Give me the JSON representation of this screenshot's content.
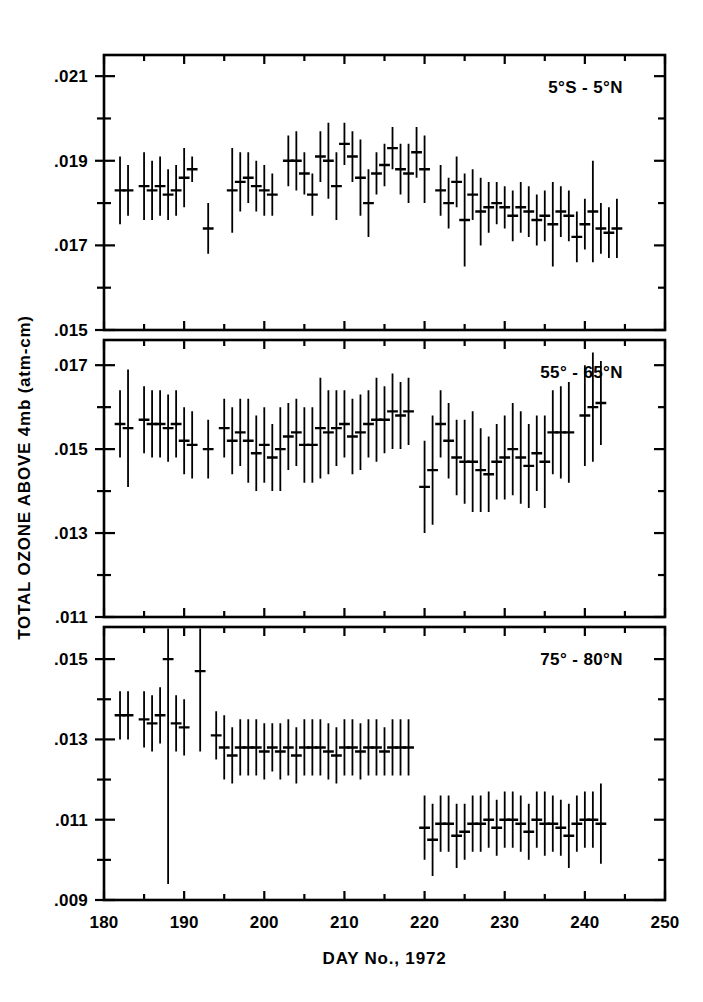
{
  "figure": {
    "background": "#ffffff",
    "ink": "#000000",
    "ylabel": "TOTAL OZONE ABOVE 4mb (atm-cm)",
    "xlabel": "DAY No., 1972"
  },
  "chart_data": {
    "type": "scatter",
    "title": "",
    "subtitle": "",
    "xlabel": "DAY No., 1972",
    "ylabel": "TOTAL OZONE ABOVE 4mb (atm-cm)",
    "grid": false,
    "legend": "none",
    "marker": "horizontal-dash-with-vertical-errorbar",
    "xlim": [
      180,
      250
    ],
    "xticks": [
      180,
      190,
      200,
      210,
      220,
      230,
      240,
      250
    ],
    "xticklabels": [
      "180",
      "190",
      "200",
      "210",
      "220",
      "230",
      "240",
      "250"
    ],
    "xminortick_step": 5,
    "panels": [
      {
        "name": "panel-equatorial",
        "label": "5°S - 5°N",
        "ylim": [
          0.015,
          0.0215
        ],
        "yticks": [
          0.015,
          0.017,
          0.019,
          0.021
        ],
        "yticklabels": [
          ".015",
          ".017",
          ".019",
          ".021"
        ],
        "yminortick_step": 0.001,
        "points": [
          {
            "x": 182,
            "y": 0.0183,
            "err": 0.0008
          },
          {
            "x": 183,
            "y": 0.0183,
            "err": 0.0006
          },
          {
            "x": 185,
            "y": 0.0184,
            "err": 0.0008
          },
          {
            "x": 186,
            "y": 0.0183,
            "err": 0.0007
          },
          {
            "x": 187,
            "y": 0.0184,
            "err": 0.0007
          },
          {
            "x": 188,
            "y": 0.0182,
            "err": 0.0006
          },
          {
            "x": 189,
            "y": 0.0183,
            "err": 0.0006
          },
          {
            "x": 190,
            "y": 0.0186,
            "err": 0.0007
          },
          {
            "x": 191,
            "y": 0.0188,
            "err": 0.0003
          },
          {
            "x": 193,
            "y": 0.0174,
            "err": 0.0006
          },
          {
            "x": 196,
            "y": 0.0183,
            "err": 0.001
          },
          {
            "x": 197,
            "y": 0.0185,
            "err": 0.0007
          },
          {
            "x": 198,
            "y": 0.0186,
            "err": 0.0006
          },
          {
            "x": 199,
            "y": 0.0184,
            "err": 0.0006
          },
          {
            "x": 200,
            "y": 0.0183,
            "err": 0.0006
          },
          {
            "x": 201,
            "y": 0.0182,
            "err": 0.0005
          },
          {
            "x": 203,
            "y": 0.019,
            "err": 0.0006
          },
          {
            "x": 204,
            "y": 0.019,
            "err": 0.0007
          },
          {
            "x": 205,
            "y": 0.0187,
            "err": 0.0005
          },
          {
            "x": 206,
            "y": 0.0182,
            "err": 0.0005
          },
          {
            "x": 207,
            "y": 0.0191,
            "err": 0.0006
          },
          {
            "x": 208,
            "y": 0.019,
            "err": 0.0009
          },
          {
            "x": 209,
            "y": 0.0184,
            "err": 0.0008
          },
          {
            "x": 210,
            "y": 0.0194,
            "err": 0.0005
          },
          {
            "x": 211,
            "y": 0.0191,
            "err": 0.0006
          },
          {
            "x": 212,
            "y": 0.0186,
            "err": 0.0009
          },
          {
            "x": 213,
            "y": 0.018,
            "err": 0.0008
          },
          {
            "x": 214,
            "y": 0.0187,
            "err": 0.0005
          },
          {
            "x": 215,
            "y": 0.0189,
            "err": 0.0005
          },
          {
            "x": 216,
            "y": 0.0193,
            "err": 0.0005
          },
          {
            "x": 217,
            "y": 0.0188,
            "err": 0.0006
          },
          {
            "x": 218,
            "y": 0.0187,
            "err": 0.0007
          },
          {
            "x": 219,
            "y": 0.0192,
            "err": 0.0006
          },
          {
            "x": 220,
            "y": 0.0188,
            "err": 0.0008
          },
          {
            "x": 222,
            "y": 0.0183,
            "err": 0.0006
          },
          {
            "x": 223,
            "y": 0.018,
            "err": 0.0006
          },
          {
            "x": 224,
            "y": 0.0185,
            "err": 0.0006
          },
          {
            "x": 225,
            "y": 0.0176,
            "err": 0.0011
          },
          {
            "x": 226,
            "y": 0.0182,
            "err": 0.0006
          },
          {
            "x": 227,
            "y": 0.0178,
            "err": 0.0008
          },
          {
            "x": 228,
            "y": 0.0179,
            "err": 0.0006
          },
          {
            "x": 229,
            "y": 0.018,
            "err": 0.0005
          },
          {
            "x": 230,
            "y": 0.0179,
            "err": 0.0005
          },
          {
            "x": 231,
            "y": 0.0177,
            "err": 0.0006
          },
          {
            "x": 232,
            "y": 0.0179,
            "err": 0.0006
          },
          {
            "x": 233,
            "y": 0.0178,
            "err": 0.0006
          },
          {
            "x": 234,
            "y": 0.0176,
            "err": 0.0006
          },
          {
            "x": 235,
            "y": 0.0177,
            "err": 0.0006
          },
          {
            "x": 236,
            "y": 0.0175,
            "err": 0.001
          },
          {
            "x": 237,
            "y": 0.0178,
            "err": 0.0006
          },
          {
            "x": 238,
            "y": 0.0177,
            "err": 0.0006
          },
          {
            "x": 239,
            "y": 0.0172,
            "err": 0.0006
          },
          {
            "x": 240,
            "y": 0.0175,
            "err": 0.0006
          },
          {
            "x": 241,
            "y": 0.0178,
            "err": 0.0012
          },
          {
            "x": 242,
            "y": 0.0174,
            "err": 0.0006
          },
          {
            "x": 243,
            "y": 0.0173,
            "err": 0.0006
          },
          {
            "x": 244,
            "y": 0.0174,
            "err": 0.0007
          }
        ]
      },
      {
        "name": "panel-midlatitude",
        "label": "55° - 65°N",
        "ylim": [
          0.011,
          0.0176
        ],
        "yticks": [
          0.011,
          0.013,
          0.015,
          0.017
        ],
        "yticklabels": [
          ".011",
          ".013",
          ".015",
          ".017"
        ],
        "yminortick_step": 0.001,
        "points": [
          {
            "x": 182,
            "y": 0.0156,
            "err": 0.0008
          },
          {
            "x": 183,
            "y": 0.0155,
            "err": 0.0014
          },
          {
            "x": 185,
            "y": 0.0157,
            "err": 0.0008
          },
          {
            "x": 186,
            "y": 0.0156,
            "err": 0.0008
          },
          {
            "x": 187,
            "y": 0.0156,
            "err": 0.0008
          },
          {
            "x": 188,
            "y": 0.0155,
            "err": 0.0008
          },
          {
            "x": 189,
            "y": 0.0156,
            "err": 0.0008
          },
          {
            "x": 190,
            "y": 0.0152,
            "err": 0.0008
          },
          {
            "x": 191,
            "y": 0.0151,
            "err": 0.0008
          },
          {
            "x": 193,
            "y": 0.015,
            "err": 0.0007
          },
          {
            "x": 195,
            "y": 0.0155,
            "err": 0.0007
          },
          {
            "x": 196,
            "y": 0.0152,
            "err": 0.0008
          },
          {
            "x": 197,
            "y": 0.0154,
            "err": 0.0008
          },
          {
            "x": 198,
            "y": 0.0152,
            "err": 0.001
          },
          {
            "x": 199,
            "y": 0.0149,
            "err": 0.0009
          },
          {
            "x": 200,
            "y": 0.0151,
            "err": 0.0009
          },
          {
            "x": 201,
            "y": 0.0148,
            "err": 0.0008
          },
          {
            "x": 202,
            "y": 0.015,
            "err": 0.001
          },
          {
            "x": 203,
            "y": 0.0153,
            "err": 0.0008
          },
          {
            "x": 204,
            "y": 0.0154,
            "err": 0.0008
          },
          {
            "x": 205,
            "y": 0.0151,
            "err": 0.0009
          },
          {
            "x": 206,
            "y": 0.0151,
            "err": 0.0009
          },
          {
            "x": 207,
            "y": 0.0155,
            "err": 0.0012
          },
          {
            "x": 208,
            "y": 0.0154,
            "err": 0.001
          },
          {
            "x": 209,
            "y": 0.0155,
            "err": 0.0009
          },
          {
            "x": 210,
            "y": 0.0156,
            "err": 0.0008
          },
          {
            "x": 211,
            "y": 0.0153,
            "err": 0.0009
          },
          {
            "x": 212,
            "y": 0.0154,
            "err": 0.0009
          },
          {
            "x": 213,
            "y": 0.0156,
            "err": 0.0008
          },
          {
            "x": 214,
            "y": 0.0157,
            "err": 0.001
          },
          {
            "x": 215,
            "y": 0.0157,
            "err": 0.0008
          },
          {
            "x": 216,
            "y": 0.0159,
            "err": 0.0009
          },
          {
            "x": 217,
            "y": 0.0158,
            "err": 0.0008
          },
          {
            "x": 218,
            "y": 0.0159,
            "err": 0.0008
          },
          {
            "x": 220,
            "y": 0.0141,
            "err": 0.0011
          },
          {
            "x": 221,
            "y": 0.0145,
            "err": 0.0013
          },
          {
            "x": 222,
            "y": 0.0156,
            "err": 0.0008
          },
          {
            "x": 223,
            "y": 0.0152,
            "err": 0.0009
          },
          {
            "x": 224,
            "y": 0.0148,
            "err": 0.0009
          },
          {
            "x": 225,
            "y": 0.0147,
            "err": 0.001
          },
          {
            "x": 226,
            "y": 0.0147,
            "err": 0.0012
          },
          {
            "x": 227,
            "y": 0.0145,
            "err": 0.001
          },
          {
            "x": 228,
            "y": 0.0144,
            "err": 0.0009
          },
          {
            "x": 229,
            "y": 0.0147,
            "err": 0.0009
          },
          {
            "x": 230,
            "y": 0.0148,
            "err": 0.001
          },
          {
            "x": 231,
            "y": 0.015,
            "err": 0.0011
          },
          {
            "x": 232,
            "y": 0.0148,
            "err": 0.0011
          },
          {
            "x": 233,
            "y": 0.0146,
            "err": 0.001
          },
          {
            "x": 234,
            "y": 0.0149,
            "err": 0.0009
          },
          {
            "x": 235,
            "y": 0.0147,
            "err": 0.0011
          },
          {
            "x": 236,
            "y": 0.0154,
            "err": 0.001
          },
          {
            "x": 237,
            "y": 0.0154,
            "err": 0.0011
          },
          {
            "x": 238,
            "y": 0.0154,
            "err": 0.0012
          },
          {
            "x": 240,
            "y": 0.0158,
            "err": 0.0012
          },
          {
            "x": 241,
            "y": 0.016,
            "err": 0.0013
          },
          {
            "x": 242,
            "y": 0.0161,
            "err": 0.001
          }
        ]
      },
      {
        "name": "panel-polar",
        "label": "75° - 80°N",
        "ylim": [
          0.009,
          0.0158
        ],
        "yticks": [
          0.009,
          0.011,
          0.013,
          0.015
        ],
        "yticklabels": [
          ".009",
          ".011",
          ".013",
          ".015"
        ],
        "yminortick_step": 0.001,
        "points": [
          {
            "x": 182,
            "y": 0.0136,
            "err": 0.0006
          },
          {
            "x": 183,
            "y": 0.0136,
            "err": 0.0006
          },
          {
            "x": 185,
            "y": 0.0135,
            "err": 0.0007
          },
          {
            "x": 186,
            "y": 0.0134,
            "err": 0.0007
          },
          {
            "x": 187,
            "y": 0.0136,
            "err": 0.0007
          },
          {
            "x": 188,
            "y": 0.015,
            "err": 0.0056
          },
          {
            "x": 189,
            "y": 0.0134,
            "err": 0.0007
          },
          {
            "x": 190,
            "y": 0.0133,
            "err": 0.0007
          },
          {
            "x": 192,
            "y": 0.0147,
            "err": 0.002
          },
          {
            "x": 194,
            "y": 0.0131,
            "err": 0.0006
          },
          {
            "x": 195,
            "y": 0.0128,
            "err": 0.0008
          },
          {
            "x": 196,
            "y": 0.0126,
            "err": 0.0007
          },
          {
            "x": 197,
            "y": 0.0128,
            "err": 0.0007
          },
          {
            "x": 198,
            "y": 0.0128,
            "err": 0.0007
          },
          {
            "x": 199,
            "y": 0.0128,
            "err": 0.0007
          },
          {
            "x": 200,
            "y": 0.0127,
            "err": 0.0007
          },
          {
            "x": 201,
            "y": 0.0128,
            "err": 0.0006
          },
          {
            "x": 202,
            "y": 0.0127,
            "err": 0.0007
          },
          {
            "x": 203,
            "y": 0.0128,
            "err": 0.0007
          },
          {
            "x": 204,
            "y": 0.0126,
            "err": 0.0007
          },
          {
            "x": 205,
            "y": 0.0128,
            "err": 0.0007
          },
          {
            "x": 206,
            "y": 0.0128,
            "err": 0.0007
          },
          {
            "x": 207,
            "y": 0.0128,
            "err": 0.0007
          },
          {
            "x": 208,
            "y": 0.0127,
            "err": 0.0007
          },
          {
            "x": 209,
            "y": 0.0126,
            "err": 0.0007
          },
          {
            "x": 210,
            "y": 0.0128,
            "err": 0.0007
          },
          {
            "x": 211,
            "y": 0.0128,
            "err": 0.0007
          },
          {
            "x": 212,
            "y": 0.0127,
            "err": 0.0007
          },
          {
            "x": 213,
            "y": 0.0128,
            "err": 0.0007
          },
          {
            "x": 214,
            "y": 0.0128,
            "err": 0.0007
          },
          {
            "x": 215,
            "y": 0.0127,
            "err": 0.0006
          },
          {
            "x": 216,
            "y": 0.0128,
            "err": 0.0007
          },
          {
            "x": 217,
            "y": 0.0128,
            "err": 0.0007
          },
          {
            "x": 218,
            "y": 0.0128,
            "err": 0.0007
          },
          {
            "x": 220,
            "y": 0.0108,
            "err": 0.0008
          },
          {
            "x": 221,
            "y": 0.0105,
            "err": 0.0009
          },
          {
            "x": 222,
            "y": 0.0109,
            "err": 0.0007
          },
          {
            "x": 223,
            "y": 0.0109,
            "err": 0.0007
          },
          {
            "x": 224,
            "y": 0.0106,
            "err": 0.0008
          },
          {
            "x": 225,
            "y": 0.0107,
            "err": 0.0007
          },
          {
            "x": 226,
            "y": 0.0109,
            "err": 0.0007
          },
          {
            "x": 227,
            "y": 0.0109,
            "err": 0.0007
          },
          {
            "x": 228,
            "y": 0.011,
            "err": 0.0007
          },
          {
            "x": 229,
            "y": 0.0108,
            "err": 0.0007
          },
          {
            "x": 230,
            "y": 0.011,
            "err": 0.0007
          },
          {
            "x": 231,
            "y": 0.011,
            "err": 0.0007
          },
          {
            "x": 232,
            "y": 0.0109,
            "err": 0.0007
          },
          {
            "x": 233,
            "y": 0.0107,
            "err": 0.0007
          },
          {
            "x": 234,
            "y": 0.011,
            "err": 0.0007
          },
          {
            "x": 235,
            "y": 0.0109,
            "err": 0.0008
          },
          {
            "x": 236,
            "y": 0.0109,
            "err": 0.0007
          },
          {
            "x": 237,
            "y": 0.0108,
            "err": 0.0007
          },
          {
            "x": 238,
            "y": 0.0106,
            "err": 0.0008
          },
          {
            "x": 239,
            "y": 0.0109,
            "err": 0.0007
          },
          {
            "x": 240,
            "y": 0.011,
            "err": 0.0007
          },
          {
            "x": 241,
            "y": 0.011,
            "err": 0.0007
          },
          {
            "x": 242,
            "y": 0.0109,
            "err": 0.001
          }
        ]
      }
    ]
  }
}
